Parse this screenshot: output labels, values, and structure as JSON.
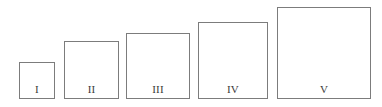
{
  "figure": {
    "type": "nested-size-comparison",
    "background_color": "#ffffff",
    "stroke_color": "#7c7c7c",
    "label_color": "#3a3a3a",
    "baseline_y": 99,
    "squares": [
      {
        "label": "I",
        "x": 19,
        "y": 62,
        "width": 36,
        "height": 37
      },
      {
        "label": "II",
        "x": 64,
        "y": 41,
        "width": 55,
        "height": 58
      },
      {
        "label": "III",
        "x": 126,
        "y": 33,
        "width": 64,
        "height": 66
      },
      {
        "label": "IV",
        "x": 198,
        "y": 22,
        "width": 70,
        "height": 77
      },
      {
        "label": "V",
        "x": 277,
        "y": 7,
        "width": 94,
        "height": 92
      }
    ]
  }
}
